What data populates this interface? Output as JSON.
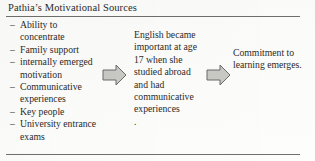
{
  "figure": {
    "title": "Pathia’s Motivational Sources",
    "arrow_fill": "#c9c9c6",
    "arrow_stroke": "#6b6b68",
    "rule_color": "#6f6f6c",
    "text_color": "#2b2b29"
  },
  "sources": {
    "bullet": "–",
    "items": [
      "Ability to concentrate",
      "Family support",
      "internally emerged motivation",
      "Communicative experiences",
      "Key people",
      "University entrance exams"
    ]
  },
  "stages": {
    "middle": {
      "text": "English became important at age 17 when she studied abroad and had communicative experiences",
      "trailing_period": "."
    },
    "right": {
      "text": "Commitment to learning emerges."
    }
  },
  "arrows": [
    {
      "name": "arrow-sources-to-experience",
      "direction": "right"
    },
    {
      "name": "arrow-experience-to-commitment",
      "direction": "right"
    }
  ]
}
